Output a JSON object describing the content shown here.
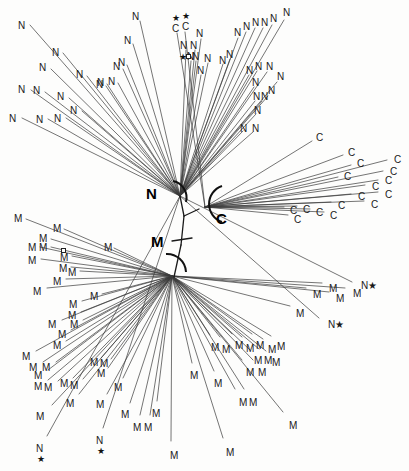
{
  "figure": {
    "type": "unrooted-phylogenetic-tree",
    "background_color": "#fdfdfc",
    "branch_color": "#3a3a3a",
    "label_color": "#1a1a1a"
  },
  "clades": {
    "n_label": "N",
    "c_label": "C",
    "m_label": "M"
  },
  "tip_text": {
    "n": "N",
    "c": "C",
    "m": "M",
    "n_star": "N★",
    "star": "★"
  },
  "chart_data": {
    "type": "tree",
    "title": "",
    "legend": [
      {
        "symbol": "N",
        "meaning": "N"
      },
      {
        "symbol": "C",
        "meaning": "C"
      },
      {
        "symbol": "M",
        "meaning": "M"
      },
      {
        "symbol": "★",
        "meaning": "star-marked taxon"
      },
      {
        "symbol": "□",
        "meaning": "square-marked taxon"
      }
    ],
    "nodes": [
      {
        "id": "n-node",
        "x": 180,
        "y": 196,
        "label": "N"
      },
      {
        "id": "c-node",
        "x": 205,
        "y": 207,
        "label": "C"
      },
      {
        "id": "m-node",
        "x": 172,
        "y": 276,
        "label": "M"
      },
      {
        "id": "internal-1",
        "x": 184,
        "y": 215,
        "label": ""
      },
      {
        "id": "internal-2",
        "x": 180,
        "y": 244,
        "label": ""
      }
    ],
    "clade_counts": {
      "N": 45,
      "C": 17,
      "M": 62
    },
    "tips": [
      {
        "label": "N",
        "x": 18,
        "y": 21,
        "ex": 30,
        "ey": 25,
        "clade": "N"
      },
      {
        "label": "N",
        "x": 52,
        "y": 48,
        "ex": 63,
        "ey": 53,
        "clade": "N"
      },
      {
        "label": "N",
        "x": 39,
        "y": 63,
        "ex": 51,
        "ey": 69,
        "clade": "N"
      },
      {
        "label": "N",
        "x": 76,
        "y": 70,
        "ex": 87,
        "ey": 76,
        "clade": "N"
      },
      {
        "label": "N",
        "x": 97,
        "y": 78,
        "ex": 107,
        "ey": 84,
        "clade": "N"
      },
      {
        "label": "N",
        "x": 108,
        "y": 77,
        "ex": 118,
        "ey": 83,
        "clade": "N"
      },
      {
        "label": "N",
        "x": 18,
        "y": 85,
        "ex": 31,
        "ey": 90,
        "clade": "N"
      },
      {
        "label": "N",
        "x": 33,
        "y": 86,
        "ex": 45,
        "ey": 92,
        "clade": "N"
      },
      {
        "label": "N",
        "x": 57,
        "y": 92,
        "ex": 69,
        "ey": 98,
        "clade": "N"
      },
      {
        "label": "N",
        "x": 9,
        "y": 114,
        "ex": 22,
        "ey": 118,
        "clade": "N"
      },
      {
        "label": "N",
        "x": 36,
        "y": 115,
        "ex": 48,
        "ey": 119,
        "clade": "N"
      },
      {
        "label": "N",
        "x": 54,
        "y": 114,
        "ex": 66,
        "ey": 118,
        "clade": "N"
      },
      {
        "label": "N",
        "x": 70,
        "y": 106,
        "ex": 82,
        "ey": 111,
        "clade": "N"
      },
      {
        "label": "N",
        "x": 124,
        "y": 36,
        "ex": 133,
        "ey": 44,
        "clade": "N"
      },
      {
        "label": "N",
        "x": 113,
        "y": 62,
        "ex": 123,
        "ey": 69,
        "clade": "N"
      },
      {
        "label": "N",
        "x": 96,
        "y": 80,
        "ex": 106,
        "ey": 86,
        "clade": "N"
      },
      {
        "label": "N",
        "x": 132,
        "y": 12,
        "ex": 140,
        "ey": 21,
        "clade": "N"
      },
      {
        "label": "N",
        "x": 118,
        "y": 58,
        "ex": 127,
        "ey": 65,
        "clade": "N"
      },
      {
        "label": "N",
        "x": 180,
        "y": 41,
        "ex": 186,
        "ey": 50,
        "clade": "N"
      },
      {
        "label": "N",
        "x": 190,
        "y": 41,
        "ex": 195,
        "ey": 50,
        "clade": "N"
      },
      {
        "label": "N",
        "x": 196,
        "y": 29,
        "ex": 201,
        "ey": 39,
        "clade": "N"
      },
      {
        "label": "N",
        "x": 219,
        "y": 56,
        "ex": 223,
        "ey": 64,
        "clade": "N"
      },
      {
        "label": "N",
        "x": 226,
        "y": 50,
        "ex": 230,
        "ey": 59,
        "clade": "N"
      },
      {
        "label": "N",
        "x": 234,
        "y": 28,
        "ex": 238,
        "ey": 38,
        "clade": "N"
      },
      {
        "label": "N",
        "x": 243,
        "y": 22,
        "ex": 246,
        "ey": 32,
        "clade": "N"
      },
      {
        "label": "N",
        "x": 252,
        "y": 18,
        "ex": 255,
        "ey": 28,
        "clade": "N"
      },
      {
        "label": "N",
        "x": 261,
        "y": 18,
        "ex": 263,
        "ey": 28,
        "clade": "N"
      },
      {
        "label": "N",
        "x": 270,
        "y": 14,
        "ex": 272,
        "ey": 25,
        "clade": "N"
      },
      {
        "label": "N",
        "x": 283,
        "y": 8,
        "ex": 284,
        "ey": 20,
        "clade": "N"
      },
      {
        "label": "N",
        "x": 246,
        "y": 66,
        "ex": 249,
        "ey": 75,
        "clade": "N"
      },
      {
        "label": "N",
        "x": 255,
        "y": 62,
        "ex": 257,
        "ey": 71,
        "clade": "N"
      },
      {
        "label": "N",
        "x": 266,
        "y": 62,
        "ex": 267,
        "ey": 72,
        "clade": "N"
      },
      {
        "label": "N",
        "x": 277,
        "y": 72,
        "ex": 277,
        "ey": 82,
        "clade": "N"
      },
      {
        "label": "N",
        "x": 252,
        "y": 78,
        "ex": 254,
        "ey": 87,
        "clade": "N"
      },
      {
        "label": "N",
        "x": 253,
        "y": 92,
        "ex": 255,
        "ey": 101,
        "clade": "N"
      },
      {
        "label": "N",
        "x": 254,
        "y": 106,
        "ex": 256,
        "ey": 114,
        "clade": "N"
      },
      {
        "label": "N",
        "x": 261,
        "y": 92,
        "ex": 262,
        "ey": 101,
        "clade": "N"
      },
      {
        "label": "N",
        "x": 268,
        "y": 86,
        "ex": 268,
        "ey": 96,
        "clade": "N"
      },
      {
        "label": "N",
        "x": 240,
        "y": 124,
        "ex": 243,
        "ey": 131,
        "clade": "N"
      },
      {
        "label": "N",
        "x": 252,
        "y": 124,
        "ex": 253,
        "ey": 132,
        "clade": "N"
      },
      {
        "label": "N",
        "x": 204,
        "y": 54,
        "ex": 208,
        "ey": 63,
        "clade": "N"
      },
      {
        "label": "N",
        "x": 197,
        "y": 66,
        "ex": 201,
        "ey": 75,
        "clade": "N"
      },
      {
        "label": "N",
        "x": 187,
        "y": 52,
        "ex": 191,
        "ey": 61,
        "clade": "N"
      },
      {
        "label": "C",
        "x": 172,
        "y": 24,
        "ex": 177,
        "ey": 33,
        "clade": "C",
        "star_above": true
      },
      {
        "label": "C",
        "x": 182,
        "y": 22,
        "ex": 185,
        "ey": 32,
        "clade": "C",
        "star_above": true
      },
      {
        "label": "N",
        "x": 192,
        "y": 52,
        "ex": 196,
        "ey": 61,
        "clade": "N",
        "square_left": true,
        "star_left": true
      },
      {
        "label": "C",
        "x": 316,
        "y": 133,
        "ex": 312,
        "ey": 141,
        "clade": "C"
      },
      {
        "label": "C",
        "x": 348,
        "y": 148,
        "ex": 343,
        "ey": 155,
        "clade": "C"
      },
      {
        "label": "C",
        "x": 357,
        "y": 159,
        "ex": 351,
        "ey": 165,
        "clade": "C"
      },
      {
        "label": "C",
        "x": 394,
        "y": 155,
        "ex": 387,
        "ey": 160,
        "clade": "C"
      },
      {
        "label": "C",
        "x": 344,
        "y": 172,
        "ex": 338,
        "ey": 177,
        "clade": "C"
      },
      {
        "label": "C",
        "x": 390,
        "y": 167,
        "ex": 383,
        "ey": 171,
        "clade": "C"
      },
      {
        "label": "C",
        "x": 385,
        "y": 176,
        "ex": 378,
        "ey": 180,
        "clade": "C"
      },
      {
        "label": "C",
        "x": 372,
        "y": 182,
        "ex": 365,
        "ey": 185,
        "clade": "C"
      },
      {
        "label": "C",
        "x": 385,
        "y": 190,
        "ex": 378,
        "ey": 192,
        "clade": "C"
      },
      {
        "label": "C",
        "x": 358,
        "y": 192,
        "ex": 351,
        "ey": 194,
        "clade": "C"
      },
      {
        "label": "C",
        "x": 371,
        "y": 200,
        "ex": 364,
        "ey": 201,
        "clade": "C"
      },
      {
        "label": "C",
        "x": 338,
        "y": 201,
        "ex": 331,
        "ey": 202,
        "clade": "C"
      },
      {
        "label": "C",
        "x": 290,
        "y": 206,
        "ex": 284,
        "ey": 207,
        "clade": "C"
      },
      {
        "label": "C",
        "x": 303,
        "y": 205,
        "ex": 297,
        "ey": 206,
        "clade": "C"
      },
      {
        "label": "C",
        "x": 316,
        "y": 208,
        "ex": 310,
        "ey": 209,
        "clade": "C"
      },
      {
        "label": "C",
        "x": 330,
        "y": 211,
        "ex": 324,
        "ey": 212,
        "clade": "C"
      },
      {
        "label": "C",
        "x": 294,
        "y": 215,
        "ex": 288,
        "ey": 215,
        "clade": "C"
      },
      {
        "label": "M",
        "x": 14,
        "y": 214,
        "ex": 26,
        "ey": 219,
        "clade": "M"
      },
      {
        "label": "M",
        "x": 53,
        "y": 224,
        "ex": 64,
        "ey": 229,
        "clade": "M"
      },
      {
        "label": "M",
        "x": 39,
        "y": 234,
        "ex": 51,
        "ey": 239,
        "clade": "M"
      },
      {
        "label": "M",
        "x": 28,
        "y": 243,
        "ex": 40,
        "ey": 247,
        "clade": "M"
      },
      {
        "label": "M",
        "x": 39,
        "y": 243,
        "ex": 51,
        "ey": 247,
        "clade": "M"
      },
      {
        "label": "M",
        "x": 28,
        "y": 256,
        "ex": 41,
        "ey": 259,
        "clade": "M"
      },
      {
        "label": "M",
        "x": 60,
        "y": 253,
        "ex": 72,
        "ey": 256,
        "clade": "M",
        "square_on": true
      },
      {
        "label": "M",
        "x": 59,
        "y": 264,
        "ex": 71,
        "ey": 267,
        "clade": "M"
      },
      {
        "label": "M",
        "x": 68,
        "y": 268,
        "ex": 80,
        "ey": 271,
        "clade": "M"
      },
      {
        "label": "M",
        "x": 53,
        "y": 277,
        "ex": 66,
        "ey": 279,
        "clade": "M"
      },
      {
        "label": "M",
        "x": 33,
        "y": 287,
        "ex": 47,
        "ey": 288,
        "clade": "M"
      },
      {
        "label": "M",
        "x": 104,
        "y": 243,
        "ex": 114,
        "ey": 248,
        "clade": "M"
      },
      {
        "label": "M",
        "x": 90,
        "y": 292,
        "ex": 102,
        "ey": 294,
        "clade": "M"
      },
      {
        "label": "M",
        "x": 69,
        "y": 300,
        "ex": 82,
        "ey": 301,
        "clade": "M"
      },
      {
        "label": "M",
        "x": 68,
        "y": 311,
        "ex": 81,
        "ey": 312,
        "clade": "M"
      },
      {
        "label": "M",
        "x": 48,
        "y": 320,
        "ex": 62,
        "ey": 320,
        "clade": "M"
      },
      {
        "label": "M",
        "x": 70,
        "y": 320,
        "ex": 83,
        "ey": 320,
        "clade": "M"
      },
      {
        "label": "M",
        "x": 58,
        "y": 330,
        "ex": 71,
        "ey": 330,
        "clade": "M"
      },
      {
        "label": "M",
        "x": 53,
        "y": 341,
        "ex": 66,
        "ey": 341,
        "clade": "M"
      },
      {
        "label": "M",
        "x": 22,
        "y": 352,
        "ex": 36,
        "ey": 351,
        "clade": "M"
      },
      {
        "label": "M",
        "x": 29,
        "y": 363,
        "ex": 43,
        "ey": 362,
        "clade": "M"
      },
      {
        "label": "M",
        "x": 42,
        "y": 363,
        "ex": 56,
        "ey": 362,
        "clade": "M"
      },
      {
        "label": "M",
        "x": 34,
        "y": 371,
        "ex": 48,
        "ey": 370,
        "clade": "M"
      },
      {
        "label": "M",
        "x": 34,
        "y": 382,
        "ex": 48,
        "ey": 380,
        "clade": "M"
      },
      {
        "label": "M",
        "x": 44,
        "y": 383,
        "ex": 58,
        "ey": 381,
        "clade": "M"
      },
      {
        "label": "M",
        "x": 60,
        "y": 379,
        "ex": 73,
        "ey": 378,
        "clade": "M"
      },
      {
        "label": "M",
        "x": 70,
        "y": 381,
        "ex": 83,
        "ey": 379,
        "clade": "M"
      },
      {
        "label": "M",
        "x": 90,
        "y": 358,
        "ex": 101,
        "ey": 358,
        "clade": "M"
      },
      {
        "label": "M",
        "x": 100,
        "y": 359,
        "ex": 111,
        "ey": 359,
        "clade": "M"
      },
      {
        "label": "M",
        "x": 97,
        "y": 369,
        "ex": 108,
        "ey": 368,
        "clade": "M"
      },
      {
        "label": "M",
        "x": 36,
        "y": 412,
        "ex": 52,
        "ey": 405,
        "clade": "M"
      },
      {
        "label": "M",
        "x": 66,
        "y": 399,
        "ex": 79,
        "ey": 394,
        "clade": "M"
      },
      {
        "label": "M",
        "x": 96,
        "y": 400,
        "ex": 107,
        "ey": 394,
        "clade": "M"
      },
      {
        "label": "M",
        "x": 121,
        "y": 410,
        "ex": 130,
        "ey": 403,
        "clade": "M"
      },
      {
        "label": "M",
        "x": 133,
        "y": 423,
        "ex": 140,
        "ey": 415,
        "clade": "M"
      },
      {
        "label": "M",
        "x": 144,
        "y": 423,
        "ex": 150,
        "ey": 415,
        "clade": "M"
      },
      {
        "label": "M",
        "x": 152,
        "y": 409,
        "ex": 157,
        "ey": 401,
        "clade": "M"
      },
      {
        "label": "M",
        "x": 114,
        "y": 383,
        "ex": 123,
        "ey": 378,
        "clade": "M"
      },
      {
        "label": "M",
        "x": 190,
        "y": 371,
        "ex": 192,
        "ey": 363,
        "clade": "M"
      },
      {
        "label": "M",
        "x": 214,
        "y": 379,
        "ex": 214,
        "ey": 371,
        "clade": "M"
      },
      {
        "label": "M",
        "x": 226,
        "y": 448,
        "ex": 223,
        "ey": 438,
        "clade": "M"
      },
      {
        "label": "M",
        "x": 289,
        "y": 421,
        "ex": 283,
        "ey": 412,
        "clade": "M"
      },
      {
        "label": "M",
        "x": 170,
        "y": 451,
        "ex": 171,
        "ey": 441,
        "clade": "M"
      },
      {
        "label": "M",
        "x": 254,
        "y": 356,
        "ex": 250,
        "ey": 350,
        "clade": "M"
      },
      {
        "label": "M",
        "x": 264,
        "y": 356,
        "ex": 259,
        "ey": 349,
        "clade": "M"
      },
      {
        "label": "M",
        "x": 246,
        "y": 368,
        "ex": 242,
        "ey": 360,
        "clade": "M"
      },
      {
        "label": "M",
        "x": 258,
        "y": 368,
        "ex": 253,
        "ey": 360,
        "clade": "M"
      },
      {
        "label": "M",
        "x": 268,
        "y": 345,
        "ex": 263,
        "ey": 339,
        "clade": "M"
      },
      {
        "label": "M",
        "x": 277,
        "y": 342,
        "ex": 271,
        "ey": 336,
        "clade": "M"
      },
      {
        "label": "M",
        "x": 272,
        "y": 358,
        "ex": 266,
        "ey": 351,
        "clade": "M"
      },
      {
        "label": "M",
        "x": 239,
        "y": 398,
        "ex": 235,
        "ey": 389,
        "clade": "M"
      },
      {
        "label": "M",
        "x": 249,
        "y": 398,
        "ex": 244,
        "ey": 389,
        "clade": "M"
      },
      {
        "label": "M",
        "x": 296,
        "y": 309,
        "ex": 290,
        "ey": 306,
        "clade": "M"
      },
      {
        "label": "M",
        "x": 313,
        "y": 290,
        "ex": 306,
        "ey": 288,
        "clade": "M"
      },
      {
        "label": "M",
        "x": 353,
        "y": 289,
        "ex": 345,
        "ey": 288,
        "clade": "M"
      },
      {
        "label": "M",
        "x": 329,
        "y": 284,
        "ex": 322,
        "ey": 283,
        "clade": "M"
      },
      {
        "label": "M",
        "x": 336,
        "y": 294,
        "ex": 329,
        "ey": 292,
        "clade": "M"
      },
      {
        "label": "M",
        "x": 211,
        "y": 343,
        "ex": 210,
        "ey": 335,
        "clade": "M"
      },
      {
        "label": "M",
        "x": 222,
        "y": 345,
        "ex": 220,
        "ey": 337,
        "clade": "M"
      },
      {
        "label": "M",
        "x": 235,
        "y": 341,
        "ex": 232,
        "ey": 334,
        "clade": "M"
      },
      {
        "label": "M",
        "x": 246,
        "y": 344,
        "ex": 242,
        "ey": 337,
        "clade": "M"
      },
      {
        "label": "M",
        "x": 256,
        "y": 341,
        "ex": 252,
        "ey": 334,
        "clade": "M"
      },
      {
        "label": "N★",
        "x": 361,
        "y": 281,
        "ex": 352,
        "ey": 282,
        "clade": "N"
      },
      {
        "label": "N★",
        "x": 328,
        "y": 320,
        "ex": 319,
        "ey": 318,
        "clade": "N"
      },
      {
        "label": "N",
        "x": 36,
        "y": 444,
        "ex": 47,
        "ey": 436,
        "clade": "N",
        "star_below": true
      },
      {
        "label": "N",
        "x": 96,
        "y": 436,
        "ex": 103,
        "ey": 428,
        "clade": "N",
        "star_below": true
      }
    ]
  }
}
